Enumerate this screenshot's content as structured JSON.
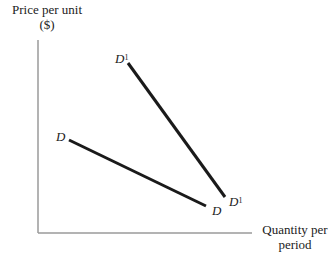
{
  "diagram": {
    "y_axis_label_line1": "Price per unit",
    "y_axis_label_line2": "($)",
    "x_axis_label_line1": "Quantity per",
    "x_axis_label_line2": "period",
    "curves": [
      {
        "name": "D",
        "label": "D",
        "start": [
          69,
          140
        ],
        "end": [
          206,
          206
        ]
      },
      {
        "name": "D1",
        "label": "D",
        "superscript": "1",
        "start": [
          128,
          63
        ],
        "end": [
          225,
          197
        ]
      }
    ],
    "colors": {
      "axis": "#999999",
      "curve": "#1a1a1a",
      "text": "#222222"
    }
  }
}
